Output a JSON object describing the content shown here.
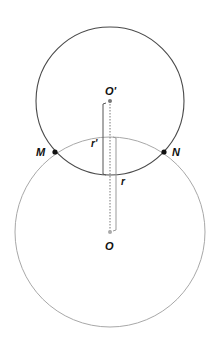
{
  "diagram": {
    "colors": {
      "upper_circle": "#4a4a4a",
      "lower_circle": "#a8a8a8",
      "points": "#111111",
      "center_dot": "#888888",
      "dotted_line": "#777777",
      "radius_bars_upper": "#555555",
      "radius_bars_lower": "#999999"
    },
    "circles": [
      {
        "name": "circle-O-prime",
        "cx": 110,
        "cy": 101,
        "r": 74
      },
      {
        "name": "circle-O",
        "cx": 110,
        "cy": 232,
        "r": 95
      }
    ],
    "labels": {
      "o_prime": "O'",
      "o": "O",
      "m": "M",
      "n": "N",
      "r_prime": "r'",
      "r": "r"
    }
  }
}
